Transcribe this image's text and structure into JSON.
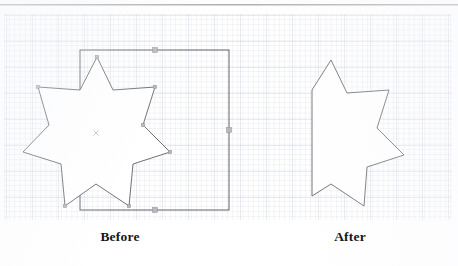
{
  "figure": {
    "captions": {
      "before": "Before",
      "after": "After"
    }
  },
  "colors": {
    "shape_stroke": "#5d5d63",
    "rect_stroke": "#60606a",
    "handle_fill": "#b9b9bd",
    "handle_stroke": "#86868c",
    "grid_line": "#8c98b4",
    "caption_text": "#17171a",
    "page_background": "#ffffff",
    "scan_edge": "#8c8c8c"
  },
  "chart_data": {
    "type": "diagram",
    "panels": [
      {
        "name": "before",
        "label": "Before",
        "description": "A seven-pointed star shape overlapping a rectangle, both selected with handles shown",
        "objects": [
          {
            "name": "rectangle",
            "type": "rect",
            "x": 80,
            "y": 50,
            "width": 149,
            "height": 160,
            "selected": true,
            "handles": [
              {
                "x": 155,
                "y": 50
              },
              {
                "x": 229,
                "y": 130
              },
              {
                "x": 155,
                "y": 210
              }
            ]
          },
          {
            "name": "seven-point-star",
            "type": "polygon",
            "points": [
              [
                97,
                57
              ],
              [
                113,
                90
              ],
              [
                155,
                87
              ],
              [
                143,
                125
              ],
              [
                170,
                152
              ],
              [
                133,
                164
              ],
              [
                129,
                206
              ],
              [
                96,
                184
              ],
              [
                65,
                206
              ],
              [
                61,
                164
              ],
              [
                23,
                152
              ],
              [
                49,
                125
              ],
              [
                38,
                87
              ],
              [
                80,
                90
              ]
            ],
            "selected": true,
            "center": [
              96,
              133
            ],
            "node_markers": [
              [
                97,
                57
              ],
              [
                155,
                87
              ],
              [
                143,
                125
              ],
              [
                170,
                152
              ],
              [
                129,
                206
              ],
              [
                65,
                206
              ],
              [
                38,
                87
              ]
            ]
          }
        ]
      },
      {
        "name": "after",
        "label": "After",
        "description": "The star clipped to the rectangle boundary; left points flattened into a vertical edge",
        "objects": [
          {
            "name": "clipped-star",
            "type": "polygon",
            "points": [
              [
                331,
                60
              ],
              [
                347,
                93
              ],
              [
                389,
                90
              ],
              [
                377,
                128
              ],
              [
                404,
                155
              ],
              [
                367,
                167
              ],
              [
                364,
                206
              ],
              [
                331,
                184
              ],
              [
                312,
                196
              ],
              [
                312,
                90
              ]
            ]
          }
        ]
      }
    ]
  }
}
